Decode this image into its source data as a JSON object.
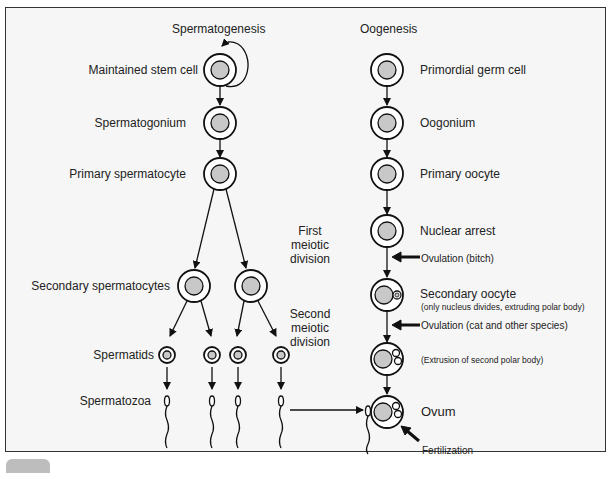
{
  "titles": {
    "left": "Spermatogenesis",
    "right": "Oogenesis"
  },
  "spermatogenesis": {
    "stages": [
      "Maintained stem cell",
      "Spermatogonium",
      "Primary spermatocyte",
      "Secondary spermatocytes",
      "Spermatids",
      "Spermatozoa"
    ]
  },
  "divisions": {
    "first": [
      "First",
      "meiotic",
      "division"
    ],
    "second": [
      "Second",
      "meiotic",
      "division"
    ]
  },
  "oogenesis": {
    "stages": [
      "Primordial germ cell",
      "Oogonium",
      "Primary oocyte",
      "Nuclear arrest",
      "Secondary oocyte",
      "Ovum"
    ],
    "secondary_note": "(only nucleus divides, extruding polar body)",
    "extrusion_note": "(Extrusion of second polar body)",
    "ovulation_bitch": "Ovulation (bitch)",
    "ovulation_cat": "Ovulation (cat and other species)",
    "fertilization": "Fertilization"
  },
  "colors": {
    "background": "#f6f6f6",
    "nucleus": "#c8c8c8",
    "stroke": "#111111",
    "frame": "#333333",
    "tab": "#bdbdbd"
  }
}
